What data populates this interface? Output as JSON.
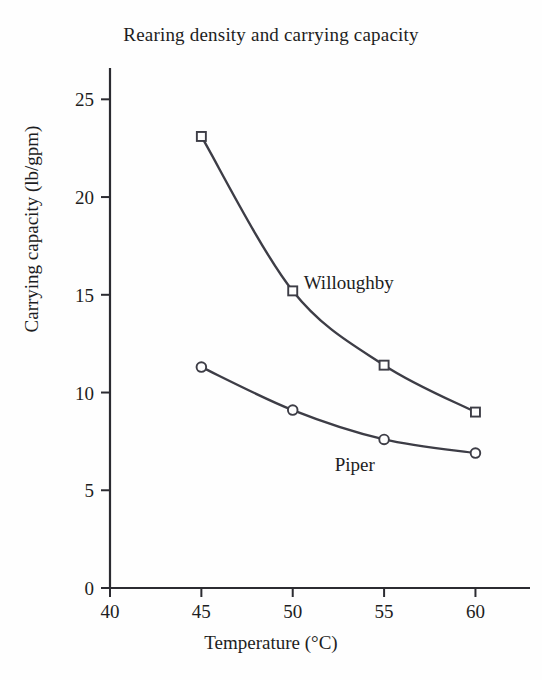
{
  "chart_data": {
    "type": "line",
    "title": "Rearing density and carrying capacity",
    "xlabel": "Temperature (°C)",
    "ylabel": "Carrying capacity (lb/gpm)",
    "x": [
      45,
      50,
      55,
      60
    ],
    "xlim": [
      40,
      62
    ],
    "ylim": [
      0,
      26.5
    ],
    "xticks": [
      "40",
      "45",
      "50",
      "55",
      "60"
    ],
    "xtick_values": [
      40,
      45,
      50,
      55,
      60
    ],
    "yticks": [
      "0",
      "5",
      "10",
      "15",
      "20",
      "25"
    ],
    "ytick_values": [
      0,
      5,
      10,
      15,
      20,
      25
    ],
    "grid": false,
    "legend_position": "inline-annotation",
    "series": [
      {
        "name": "Willoughby",
        "marker": "open-square",
        "color": "#3d3d46",
        "values": [
          23.1,
          15.2,
          11.4,
          9.0
        ]
      },
      {
        "name": "Piper",
        "marker": "open-circle",
        "color": "#3d3d46",
        "values": [
          11.3,
          9.1,
          7.6,
          6.9
        ]
      }
    ],
    "annotations": [
      {
        "text": "Willoughby",
        "x": 50.6,
        "y": 15.3
      },
      {
        "text": "Piper",
        "x": 52.3,
        "y": 6.0
      }
    ]
  },
  "axis": {
    "line_color": "#2b2b31",
    "background": "#fefefe"
  }
}
